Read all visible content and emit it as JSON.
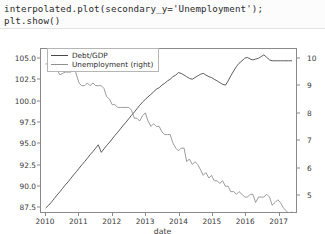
{
  "notebook": {
    "code_lines": [
      "interpolated.plot(secondary_y='Unemployment');",
      "plt.show()"
    ]
  },
  "figure": {
    "xlabel": "date",
    "legend": {
      "items": [
        {
          "label": "Debt/GDP",
          "color": "#4a4a4a"
        },
        {
          "label": "Unemployment (right)",
          "color": "#8f8f8f"
        }
      ]
    },
    "left_axis": {
      "ticks": [
        "105.0",
        "102.5",
        "100.0",
        "97.5",
        "95.0",
        "92.5",
        "90.0",
        "87.5"
      ]
    },
    "right_axis": {
      "ticks": [
        "10",
        "9",
        "8",
        "7",
        "6",
        "5"
      ]
    },
    "x_axis": {
      "ticks": [
        "2010",
        "2011",
        "2012",
        "2013",
        "2014",
        "2015",
        "2016",
        "2017"
      ]
    }
  },
  "chart_data": {
    "type": "line",
    "title": "",
    "xlabel": "date",
    "ylabel": "",
    "grid": false,
    "legend_position": "upper-left",
    "x": [
      2010.0,
      2010.08,
      2010.17,
      2010.25,
      2010.33,
      2010.42,
      2010.5,
      2010.58,
      2010.67,
      2010.75,
      2010.83,
      2010.92,
      2011.0,
      2011.08,
      2011.17,
      2011.25,
      2011.33,
      2011.42,
      2011.5,
      2011.58,
      2011.67,
      2011.75,
      2011.83,
      2011.92,
      2012.0,
      2012.08,
      2012.17,
      2012.25,
      2012.33,
      2012.42,
      2012.5,
      2012.58,
      2012.67,
      2012.75,
      2012.83,
      2012.92,
      2013.0,
      2013.08,
      2013.17,
      2013.25,
      2013.33,
      2013.42,
      2013.5,
      2013.58,
      2013.67,
      2013.75,
      2013.83,
      2013.92,
      2014.0,
      2014.08,
      2014.17,
      2014.25,
      2014.33,
      2014.42,
      2014.5,
      2014.58,
      2014.67,
      2014.75,
      2014.83,
      2014.92,
      2015.0,
      2015.08,
      2015.17,
      2015.25,
      2015.33,
      2015.42,
      2015.5,
      2015.58,
      2015.67,
      2015.75,
      2015.83,
      2015.92,
      2016.0,
      2016.08,
      2016.17,
      2016.25,
      2016.33,
      2016.42,
      2016.5,
      2016.58,
      2016.67,
      2016.75,
      2016.83,
      2016.92,
      2017.0,
      2017.08,
      2017.17,
      2017.25,
      2017.33,
      2017.42
    ],
    "series": [
      {
        "name": "Debt/GDP",
        "axis": "left",
        "color": "#4a4a4a",
        "ylim": [
          86.8,
          106.2
        ],
        "values": [
          87.3,
          87.6,
          88.0,
          88.4,
          88.8,
          89.2,
          89.6,
          90.0,
          90.4,
          90.8,
          91.2,
          91.6,
          92.0,
          92.4,
          92.8,
          93.2,
          93.6,
          94.0,
          94.4,
          94.8,
          93.9,
          94.3,
          94.7,
          95.1,
          95.5,
          95.9,
          96.3,
          96.7,
          97.1,
          97.5,
          97.9,
          98.3,
          98.7,
          99.1,
          99.5,
          99.9,
          100.2,
          100.5,
          100.8,
          101.1,
          101.4,
          101.6,
          101.9,
          102.1,
          102.4,
          102.6,
          102.9,
          103.1,
          103.4,
          103.3,
          103.1,
          102.9,
          102.7,
          102.6,
          102.8,
          103.0,
          103.2,
          103.3,
          103.1,
          102.9,
          102.8,
          102.6,
          102.4,
          102.2,
          102.0,
          101.9,
          102.4,
          103.0,
          103.6,
          104.1,
          104.5,
          104.8,
          105.1,
          105.2,
          105.0,
          104.9,
          105.0,
          105.1,
          105.3,
          105.5,
          105.2,
          104.9,
          104.8,
          104.8,
          104.8,
          104.8,
          104.8,
          104.8,
          104.8,
          104.8
        ]
      },
      {
        "name": "Unemployment (right)",
        "axis": "right",
        "color": "#8f8f8f",
        "ylim": [
          4.35,
          10.35
        ],
        "values": [
          9.8,
          9.8,
          9.9,
          9.9,
          9.6,
          9.4,
          9.45,
          9.5,
          9.5,
          9.5,
          9.8,
          9.4,
          9.1,
          9.0,
          9.0,
          9.1,
          9.0,
          9.1,
          9.0,
          9.0,
          9.0,
          8.9,
          8.6,
          8.5,
          8.3,
          8.3,
          8.2,
          8.2,
          8.2,
          8.2,
          8.2,
          8.1,
          7.8,
          7.8,
          7.7,
          7.9,
          8.0,
          7.7,
          7.5,
          7.6,
          7.5,
          7.5,
          7.3,
          7.2,
          7.2,
          7.2,
          6.9,
          6.7,
          6.6,
          6.7,
          6.7,
          6.2,
          6.3,
          6.1,
          6.2,
          6.1,
          5.9,
          5.7,
          5.8,
          5.6,
          5.7,
          5.5,
          5.5,
          5.4,
          5.5,
          5.3,
          5.3,
          5.1,
          5.1,
          5.0,
          5.1,
          5.0,
          4.9,
          4.9,
          5.0,
          5.0,
          4.7,
          4.9,
          4.9,
          4.9,
          5.0,
          4.9,
          4.6,
          4.7,
          4.8,
          4.7,
          4.5,
          4.4,
          4.3,
          4.35
        ]
      }
    ]
  }
}
